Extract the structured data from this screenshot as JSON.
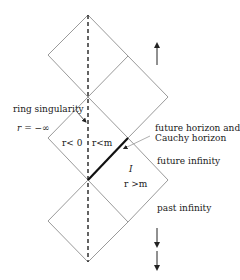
{
  "diagram": {
    "type": "Penrose-Carter diagram (Kerr black hole, ring singularity)",
    "labels": {
      "ring_singularity": "ring singularity",
      "r_minus_infinity": "r = −∞",
      "r_less_zero": "r< 0",
      "r_less_m": "r<m",
      "future_horizon_line1": "future horizon and",
      "future_horizon_line2": "Cauchy horizon",
      "future_infinity": "future infinity",
      "region_I": "I",
      "r_greater_m": "r >m",
      "past_infinity": "past infinity"
    },
    "colors": {
      "lines": "#9a9a9a",
      "thick_horizon": "#111111",
      "dashed_axis": "#222222",
      "text": "#1a1a1a"
    }
  }
}
